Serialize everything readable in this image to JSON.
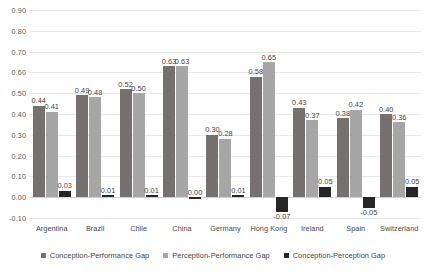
{
  "chart_data": {
    "type": "bar",
    "title": "",
    "subtitle": "",
    "xlabel": "",
    "ylabel": "",
    "ylim": [
      -0.1,
      0.9
    ],
    "ytick_step": 0.1,
    "ytick_labels": [
      "0.90",
      "0.80",
      "0.70",
      "0.60",
      "0.50",
      "0.40",
      "0.30",
      "0.20",
      "0.10",
      "0.00",
      "-0.10"
    ],
    "ytick_values": [
      0.9,
      0.8,
      0.7,
      0.6,
      0.5,
      0.4,
      0.3,
      0.2,
      0.1,
      0.0,
      -0.1
    ],
    "grid": true,
    "legend_position": "bottom",
    "categories": [
      "Argentina",
      "Brazil",
      "Chile",
      "China",
      "Germany",
      "Hong Kong",
      "Ireland",
      "Spain",
      "Switzerland"
    ],
    "series": [
      {
        "name": "Conception-Performance Gap",
        "color": "#767171",
        "values": [
          0.44,
          0.49,
          0.52,
          0.63,
          0.3,
          0.58,
          0.43,
          0.38,
          0.4
        ],
        "labels": [
          "0.44",
          "0.49",
          "0.52",
          "0.63",
          "0.30",
          "0.58",
          "0.43",
          "0.38",
          "0.40"
        ]
      },
      {
        "name": "Perception-Performance Gap",
        "color": "#a6a6a6",
        "values": [
          0.41,
          0.48,
          0.5,
          0.63,
          0.28,
          0.65,
          0.37,
          0.42,
          0.36
        ],
        "labels": [
          "0.41",
          "0.48",
          "0.50",
          "0.63",
          "0.28",
          "0.65",
          "0.37",
          "0.42",
          "0.36"
        ]
      },
      {
        "name": "Conception-Perception Gap",
        "color": "#262626",
        "values": [
          0.03,
          0.01,
          0.01,
          0.0,
          0.01,
          -0.07,
          0.05,
          -0.05,
          0.05
        ],
        "labels": [
          "0.03",
          "0.01",
          "0.01",
          "0.00",
          "0.01",
          "-0.07",
          "0.05",
          "-0.05",
          "0.05"
        ]
      }
    ]
  }
}
